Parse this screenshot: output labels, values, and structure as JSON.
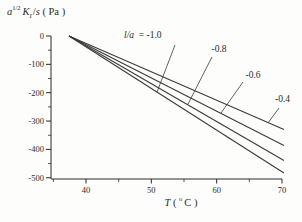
{
  "figure": {
    "background": "#fdfdfb",
    "text_color": "#2b2b2b",
    "line_color": "#3a3a3a"
  },
  "chart_data": {
    "type": "line",
    "title": "",
    "ylabel": "a^(1/2) K_I /s ( Pa )",
    "ylabel_parts": [
      {
        "t": "a",
        "s": "i"
      },
      {
        "t": "1/2",
        "s": "sup"
      },
      {
        "t": "K",
        "s": "i"
      },
      {
        "t": "I",
        "s": "sub"
      },
      {
        "t": "/",
        "s": "n"
      },
      {
        "t": "s",
        "s": "i"
      },
      {
        "t": " ( Pa )",
        "s": "n"
      }
    ],
    "xlabel": "T ( °C )",
    "xlabel_parts": [
      {
        "t": "T",
        "s": "i"
      },
      {
        "t": " ( ",
        "s": "n"
      },
      {
        "t": "o",
        "s": "sup"
      },
      {
        "t": "C )",
        "s": "n"
      }
    ],
    "xlim": [
      34.6,
      70.3
    ],
    "ylim": [
      -500,
      0
    ],
    "xticks": [
      40,
      50,
      60,
      70
    ],
    "xtick_labels": [
      "40",
      "50",
      "60",
      "70"
    ],
    "xticks_minor": [
      35,
      45,
      55,
      65
    ],
    "yticks": [
      0,
      -100,
      -200,
      -300,
      -400,
      -500
    ],
    "ytick_labels": [
      "0",
      "-100",
      "-200",
      "-300",
      "-400",
      "-500"
    ],
    "yticks_minor": [
      -50,
      -150,
      -250,
      -350,
      -450
    ],
    "grid": false,
    "legend_position": "none",
    "series": [
      {
        "label": "l/a = -1.0",
        "l_over_a": -1.0,
        "value_at_70C": -480,
        "points": [
          [
            37.4,
            0
          ],
          [
            70.3,
            -483
          ]
        ]
      },
      {
        "label": "-0.8",
        "l_over_a": -0.8,
        "value_at_70C": -437,
        "points": [
          [
            37.4,
            0
          ],
          [
            70.3,
            -439
          ]
        ]
      },
      {
        "label": "-0.6",
        "l_over_a": -0.6,
        "value_at_70C": -384,
        "points": [
          [
            37.4,
            0
          ],
          [
            70.3,
            -386
          ]
        ]
      },
      {
        "label": "-0.4",
        "l_over_a": -0.4,
        "value_at_70C": -328,
        "points": [
          [
            37.4,
            0
          ],
          [
            70.3,
            -330
          ]
        ]
      }
    ],
    "annotations": [
      {
        "text": "l/a  = -1.0",
        "anchor": "start",
        "x": 124,
        "y": 38,
        "leader": {
          "x1": 175,
          "y1": 45,
          "x2": 157,
          "y2": 92
        }
      },
      {
        "text": "-0.8",
        "anchor": "middle",
        "x": 219,
        "y": 52,
        "leader": {
          "x1": 212,
          "y1": 57,
          "x2": 188,
          "y2": 104
        }
      },
      {
        "text": "-0.6",
        "anchor": "middle",
        "x": 253,
        "y": 77.5,
        "leader": {
          "x1": 243,
          "y1": 82,
          "x2": 221,
          "y2": 113
        }
      },
      {
        "text": "-0.4",
        "anchor": "middle",
        "x": 282.5,
        "y": 102,
        "leader": {
          "x1": 279,
          "y1": 108,
          "x2": 268,
          "y2": 123
        }
      }
    ]
  }
}
